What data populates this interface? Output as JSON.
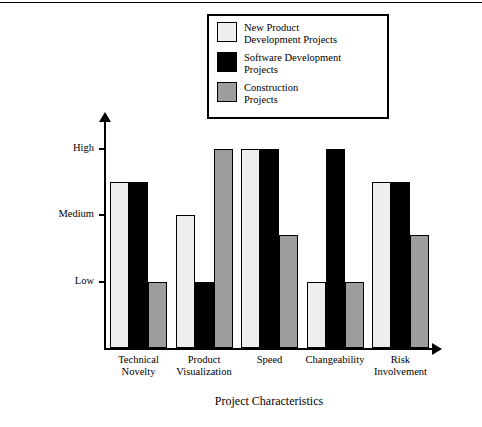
{
  "chart_data": {
    "type": "bar",
    "title": "",
    "xlabel": "Project Characteristics",
    "ylabel": "Degree of Intensity of Project Characteristics",
    "categories": [
      "Technical\nNovelty",
      "Product\nVisualization",
      "Speed",
      "Changeability",
      "Risk\nInvolvement"
    ],
    "ytick_labels": [
      "Low",
      "Medium",
      "High"
    ],
    "ytick_values": [
      1,
      2,
      3
    ],
    "ylim": [
      0,
      3.35
    ],
    "grid": false,
    "legend_position": "top-right",
    "series": [
      {
        "name": "New Product\nDevelopment Projects",
        "color": "#eeeeec",
        "values": [
          2.5,
          2.0,
          3.0,
          1.0,
          2.5
        ]
      },
      {
        "name": "Software Development\nProjects",
        "color": "#000000",
        "values": [
          2.5,
          1.0,
          3.0,
          3.0,
          2.5
        ]
      },
      {
        "name": "Construction\nProjects",
        "color": "#9d9d9b",
        "values": [
          1.0,
          3.0,
          1.7,
          1.0,
          1.7
        ]
      }
    ]
  },
  "legend": {
    "items": [
      {
        "label": "New Product\nDevelopment Projects",
        "color": "#eeeeec"
      },
      {
        "label": "Software Development\nProjects",
        "color": "#000000"
      },
      {
        "label": "Construction\nProjects",
        "color": "#9d9d9b"
      }
    ]
  },
  "axes": {
    "y_title": "Degree of Intensity of Project Characteristics",
    "x_title": "Project Characteristics"
  }
}
